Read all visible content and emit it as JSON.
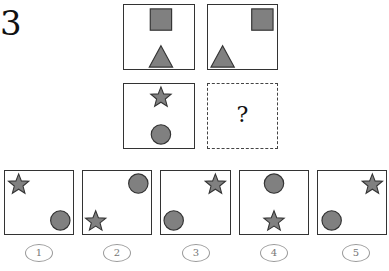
{
  "problem": {
    "number": "3",
    "question_mark": "?",
    "shape_fill": "#808080",
    "shape_stroke": "#333333"
  },
  "grid": [
    {
      "id": "top-left",
      "shapes": [
        {
          "type": "square",
          "position": "top-center"
        },
        {
          "type": "triangle",
          "position": "bottom-center"
        }
      ]
    },
    {
      "id": "top-right",
      "shapes": [
        {
          "type": "square",
          "position": "top-right"
        },
        {
          "type": "triangle",
          "position": "bottom-left"
        }
      ]
    },
    {
      "id": "bottom-left",
      "shapes": [
        {
          "type": "star",
          "position": "top-center"
        },
        {
          "type": "circle",
          "position": "bottom-center"
        }
      ]
    },
    {
      "id": "bottom-right",
      "shapes": [],
      "placeholder": "?"
    }
  ],
  "options": [
    {
      "label": "1",
      "shapes": [
        {
          "type": "star",
          "position": "top-left"
        },
        {
          "type": "circle",
          "position": "bottom-right"
        }
      ]
    },
    {
      "label": "2",
      "shapes": [
        {
          "type": "circle",
          "position": "top-right"
        },
        {
          "type": "star",
          "position": "bottom-left"
        }
      ]
    },
    {
      "label": "3",
      "shapes": [
        {
          "type": "star",
          "position": "top-right"
        },
        {
          "type": "circle",
          "position": "bottom-left"
        }
      ]
    },
    {
      "label": "4",
      "shapes": [
        {
          "type": "circle",
          "position": "top-center"
        },
        {
          "type": "star",
          "position": "bottom-center"
        }
      ]
    },
    {
      "label": "5",
      "shapes": [
        {
          "type": "star",
          "position": "top-right"
        },
        {
          "type": "circle",
          "position": "bottom-left"
        }
      ]
    }
  ]
}
